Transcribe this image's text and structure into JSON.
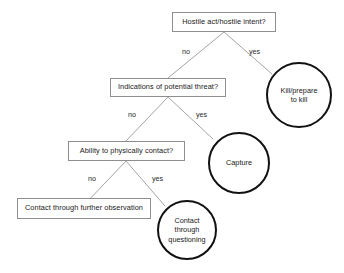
{
  "diagram": {
    "type": "decision-tree",
    "background_color": "#ffffff",
    "box_border_color": "#8e8e8e",
    "circle_border_color": "#111111",
    "edge_color": "#9a9a9a",
    "text_color": "#1a1a1a",
    "nodes": {
      "hostile_act": {
        "label": "Hostile act/hostile intent?",
        "shape": "rectangle",
        "role": "decision"
      },
      "kill_prepare": {
        "label": "Kill/prepare\nto kill",
        "shape": "circle",
        "role": "outcome"
      },
      "indications_threat": {
        "label": "Indications of potential threat?",
        "shape": "rectangle",
        "role": "decision"
      },
      "capture": {
        "label": "Capture",
        "shape": "circle",
        "role": "outcome"
      },
      "ability_contact": {
        "label": "Ability to physically contact?",
        "shape": "rectangle",
        "role": "decision"
      },
      "further_observation": {
        "label": "Contact through further observation",
        "shape": "rectangle",
        "role": "terminal"
      },
      "contact_questioning": {
        "label": "Contact\nthrough\nquestioning",
        "shape": "circle",
        "role": "outcome"
      }
    },
    "edge_labels": {
      "level1_no": "no",
      "level1_yes": "yes",
      "level2_no": "no",
      "level2_yes": "yes",
      "level3_no": "no",
      "level3_yes": "yes"
    },
    "edges": [
      {
        "from": "hostile_act",
        "to": "indications_threat",
        "label": "no"
      },
      {
        "from": "hostile_act",
        "to": "kill_prepare",
        "label": "yes"
      },
      {
        "from": "indications_threat",
        "to": "ability_contact",
        "label": "no"
      },
      {
        "from": "indications_threat",
        "to": "capture",
        "label": "yes"
      },
      {
        "from": "ability_contact",
        "to": "further_observation",
        "label": "no"
      },
      {
        "from": "ability_contact",
        "to": "contact_questioning",
        "label": "yes"
      }
    ]
  }
}
